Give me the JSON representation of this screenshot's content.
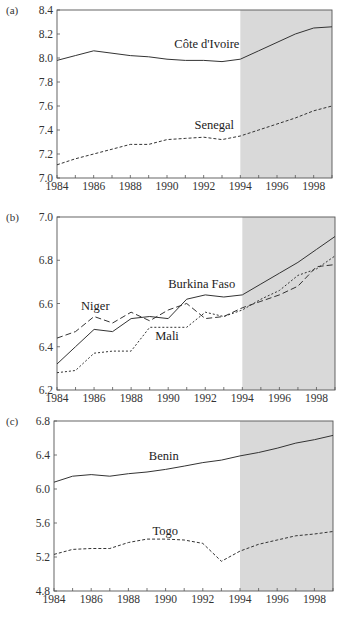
{
  "shade_color": "#d9d9d9",
  "line_color": "#333333",
  "chart_data": [
    {
      "type": "line",
      "panel_label": "(a)",
      "title": "",
      "xlabel": "",
      "ylabel": "",
      "x": [
        1984,
        1985,
        1986,
        1987,
        1988,
        1989,
        1990,
        1991,
        1992,
        1993,
        1994,
        1995,
        1996,
        1997,
        1998,
        1999
      ],
      "xlim": [
        1984,
        1999
      ],
      "ylim": [
        7.0,
        8.4
      ],
      "x_ticks": [
        1984,
        1986,
        1988,
        1990,
        1992,
        1994,
        1996,
        1998
      ],
      "y_ticks": [
        7.0,
        7.2,
        7.4,
        7.6,
        7.8,
        8.0,
        8.2,
        8.4
      ],
      "y_tick_labels": [
        "7.0",
        "7.2",
        "7.4",
        "7.6",
        "7.8",
        "8.0",
        "8.2",
        "8.4"
      ],
      "shaded_region": [
        1994,
        1999
      ],
      "grid": false,
      "series": [
        {
          "name": "Côte d'Ivoire",
          "style": "solid",
          "values": [
            7.98,
            8.02,
            8.06,
            8.04,
            8.02,
            8.01,
            7.99,
            7.98,
            7.98,
            7.97,
            7.99,
            8.06,
            8.13,
            8.2,
            8.25,
            8.26
          ],
          "label_x": 1990.4,
          "label_y": 8.08
        },
        {
          "name": "Senegal",
          "style": "dashed",
          "values": [
            7.11,
            7.16,
            7.2,
            7.24,
            7.28,
            7.28,
            7.32,
            7.33,
            7.34,
            7.32,
            7.35,
            7.4,
            7.45,
            7.5,
            7.56,
            7.6
          ],
          "label_x": 1991.5,
          "label_y": 7.41
        }
      ]
    },
    {
      "type": "line",
      "panel_label": "(b)",
      "title": "",
      "xlabel": "",
      "ylabel": "",
      "x": [
        1984,
        1985,
        1986,
        1987,
        1988,
        1989,
        1990,
        1991,
        1992,
        1993,
        1994,
        1995,
        1996,
        1997,
        1998,
        1999
      ],
      "xlim": [
        1984,
        1999
      ],
      "ylim": [
        6.2,
        7.0
      ],
      "x_ticks": [
        1984,
        1986,
        1988,
        1990,
        1992,
        1994,
        1996,
        1998
      ],
      "y_ticks": [
        6.2,
        6.4,
        6.6,
        6.8,
        7.0
      ],
      "y_tick_labels": [
        "6.2",
        "6.4",
        "6.6",
        "6.8",
        "7.0"
      ],
      "shaded_region": [
        1994,
        1999
      ],
      "grid": false,
      "series": [
        {
          "name": "Burkina Faso",
          "style": "solid",
          "values": [
            6.32,
            6.4,
            6.48,
            6.47,
            6.53,
            6.54,
            6.53,
            6.62,
            6.64,
            6.63,
            6.64,
            6.69,
            6.74,
            6.79,
            6.85,
            6.91
          ],
          "label_x": 1990.0,
          "label_y": 6.67
        },
        {
          "name": "Niger",
          "style": "longdash",
          "values": [
            6.44,
            6.47,
            6.54,
            6.51,
            6.56,
            6.52,
            6.57,
            6.6,
            6.53,
            6.54,
            6.58,
            6.61,
            6.64,
            6.68,
            6.77,
            6.78
          ],
          "label_x": 1985.3,
          "label_y": 6.57
        },
        {
          "name": "Mali",
          "style": "shortdash",
          "values": [
            6.28,
            6.29,
            6.37,
            6.38,
            6.38,
            6.49,
            6.49,
            6.49,
            6.56,
            6.54,
            6.57,
            6.62,
            6.66,
            6.73,
            6.76,
            6.82
          ],
          "label_x": 1989.3,
          "label_y": 6.43
        }
      ]
    },
    {
      "type": "line",
      "panel_label": "(c)",
      "title": "",
      "xlabel": "",
      "ylabel": "",
      "x": [
        1984,
        1985,
        1986,
        1987,
        1988,
        1989,
        1990,
        1991,
        1992,
        1993,
        1994,
        1995,
        1996,
        1997,
        1998,
        1999
      ],
      "xlim": [
        1984,
        1999
      ],
      "ylim": [
        4.8,
        6.8
      ],
      "x_ticks": [
        1984,
        1986,
        1988,
        1990,
        1992,
        1994,
        1996,
        1998
      ],
      "y_ticks": [
        4.8,
        5.2,
        5.6,
        6.0,
        6.4,
        6.8
      ],
      "y_tick_labels": [
        "4.8",
        "5.2",
        "5.6",
        "6.0",
        "6.4",
        "6.8"
      ],
      "shaded_region": [
        1994,
        1999
      ],
      "grid": false,
      "series": [
        {
          "name": "Benin",
          "style": "solid",
          "values": [
            6.08,
            6.15,
            6.17,
            6.15,
            6.18,
            6.2,
            6.23,
            6.27,
            6.31,
            6.34,
            6.39,
            6.43,
            6.48,
            6.54,
            6.58,
            6.63
          ],
          "label_x": 1989.1,
          "label_y": 6.34
        },
        {
          "name": "Togo",
          "style": "dashed",
          "values": [
            5.23,
            5.29,
            5.3,
            5.3,
            5.37,
            5.41,
            5.41,
            5.4,
            5.36,
            5.15,
            5.27,
            5.35,
            5.4,
            5.45,
            5.47,
            5.5
          ],
          "label_x": 1989.3,
          "label_y": 5.46
        }
      ]
    }
  ],
  "layout": [
    {
      "x0": 57,
      "x1": 332,
      "y0": 10,
      "y1": 178
    },
    {
      "x0": 57,
      "x1": 335,
      "y0": 217,
      "y1": 390
    },
    {
      "x0": 54,
      "x1": 333,
      "y0": 421,
      "y1": 591
    }
  ]
}
